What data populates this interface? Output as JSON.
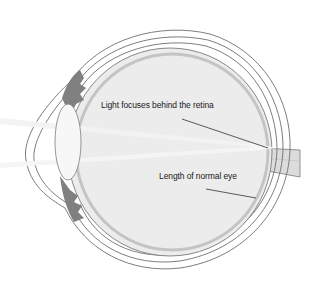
{
  "diagram": {
    "labels": [
      {
        "id": "focus",
        "text": "Light focuses behind the retina"
      },
      {
        "id": "length",
        "text": "Length of normal eye"
      }
    ],
    "colors": {
      "background": "#ffffff",
      "vitreous": "#ebebeb",
      "outline": "#6e6e6e",
      "ciliary": "#7d7d7d",
      "lens": "#f6f6f6",
      "nerve": "#d8d8d8",
      "light_rays": "#f4f4f4",
      "leader_line": "#333333"
    }
  }
}
